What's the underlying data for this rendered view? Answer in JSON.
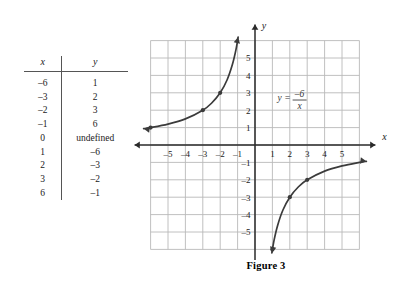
{
  "table": {
    "headers": [
      "x",
      "y"
    ],
    "rows": [
      {
        "x": "–6",
        "y": "1"
      },
      {
        "x": "–3",
        "y": "2"
      },
      {
        "x": "–2",
        "y": "3"
      },
      {
        "x": "–1",
        "y": "6"
      },
      {
        "x": "0",
        "y": "undefined"
      },
      {
        "x": "1",
        "y": "–6"
      },
      {
        "x": "2",
        "y": "–3"
      },
      {
        "x": "3",
        "y": "–2"
      },
      {
        "x": "6",
        "y": "–1"
      }
    ]
  },
  "figure": {
    "caption": "Figure 3",
    "equation": {
      "lhs": "y =",
      "numerator": "–6",
      "denominator": "x"
    },
    "axis_labels": {
      "x": "x",
      "y": "y"
    }
  },
  "chart_data": {
    "type": "line",
    "title": "Figure 3",
    "equation": "y = -6/x",
    "xlabel": "x",
    "ylabel": "y",
    "xlim": [
      -6.5,
      6.5
    ],
    "ylim": [
      -6.5,
      6.5
    ],
    "grid": true,
    "grid_color": "#b9b9b9",
    "curve_color": "#3b3b3b",
    "axis_color": "#2a2a2a",
    "xticks": [
      -5,
      -4,
      -3,
      -2,
      -1,
      1,
      2,
      3,
      4,
      5
    ],
    "yticks": [
      5,
      4,
      3,
      2,
      1,
      -1,
      -2,
      -3,
      -4,
      -5
    ],
    "xtick_labels": [
      "–5",
      "–4",
      "–3",
      "–2",
      "–1",
      "1",
      "2",
      "3",
      "4",
      "5"
    ],
    "ytick_labels": [
      "5",
      "4",
      "3",
      "2",
      "1",
      "–1",
      "–2",
      "–3",
      "–4",
      "–5"
    ],
    "series": [
      {
        "name": "y = -6/x (x < 0)",
        "points": [
          {
            "x": -6.4,
            "y": 0.94
          },
          {
            "x": -6,
            "y": 1
          },
          {
            "x": -5,
            "y": 1.2
          },
          {
            "x": -4,
            "y": 1.5
          },
          {
            "x": -3,
            "y": 2
          },
          {
            "x": -2.5,
            "y": 2.4
          },
          {
            "x": -2,
            "y": 3
          },
          {
            "x": -1.6,
            "y": 3.75
          },
          {
            "x": -1.3,
            "y": 4.62
          },
          {
            "x": -1.1,
            "y": 5.45
          },
          {
            "x": -0.97,
            "y": 6.2
          }
        ]
      },
      {
        "name": "y = -6/x (x > 0)",
        "points": [
          {
            "x": 0.97,
            "y": -6.2
          },
          {
            "x": 1.1,
            "y": -5.45
          },
          {
            "x": 1.3,
            "y": -4.62
          },
          {
            "x": 1.6,
            "y": -3.75
          },
          {
            "x": 2,
            "y": -3
          },
          {
            "x": 2.5,
            "y": -2.4
          },
          {
            "x": 3,
            "y": -2
          },
          {
            "x": 4,
            "y": -1.5
          },
          {
            "x": 5,
            "y": -1.2
          },
          {
            "x": 6,
            "y": -1
          },
          {
            "x": 6.4,
            "y": -0.94
          }
        ]
      }
    ],
    "marked_points": [
      {
        "x": -6,
        "y": 1
      },
      {
        "x": -3,
        "y": 2
      },
      {
        "x": -2,
        "y": 3
      },
      {
        "x": 1,
        "y": -6
      },
      {
        "x": 2,
        "y": -3
      },
      {
        "x": 3,
        "y": -2
      }
    ]
  }
}
